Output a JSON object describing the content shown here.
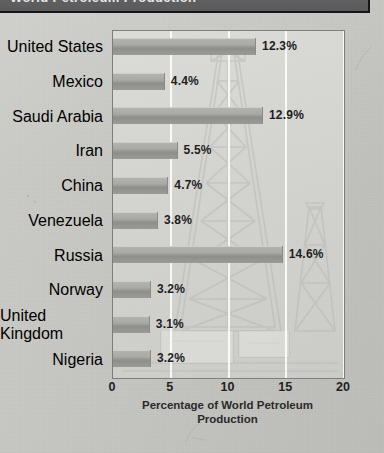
{
  "header": {
    "title": "World Petroleum Production",
    "cropped": true
  },
  "figure": {
    "caption_line1": "Percentage of World Petroleum",
    "caption_line2": "Production",
    "watermark": "oil-derrick-illustration"
  },
  "chart_data": {
    "type": "bar",
    "orientation": "horizontal",
    "title": "World Petroleum Production",
    "xlabel": "Percentage of World Petroleum Production",
    "ylabel": "",
    "xlim": [
      0,
      20
    ],
    "xticks": [
      "0",
      "5",
      "10",
      "15",
      "20"
    ],
    "grid": true,
    "legend": "none",
    "categories": [
      "United States",
      "Mexico",
      "Saudi Arabia",
      "Iran",
      "China",
      "Venezuela",
      "Russia",
      "Norway",
      "United Kingdom",
      "Nigeria"
    ],
    "values": [
      12.3,
      4.4,
      12.9,
      5.5,
      4.7,
      3.8,
      14.6,
      3.2,
      3.1,
      3.2
    ],
    "value_labels": [
      "12.3%",
      "4.4%",
      "12.9%",
      "5.5%",
      "4.7%",
      "3.8%",
      "14.6%",
      "3.2%",
      "3.1%",
      "3.2%"
    ],
    "series": [
      {
        "name": "Percentage of World Petroleum Production",
        "values": [
          12.3,
          4.4,
          12.9,
          5.5,
          4.7,
          3.8,
          14.6,
          3.2,
          3.1,
          3.2
        ]
      }
    ]
  },
  "colors": {
    "page_background": "#c8c8c3",
    "header_band": "#5f5f5f",
    "header_text": "#e9e9e9",
    "bar_fill": "#a8a8a5",
    "plot_border": "#7d7d7a",
    "gridline": "#ffffff",
    "text": "#1e1e1e"
  }
}
